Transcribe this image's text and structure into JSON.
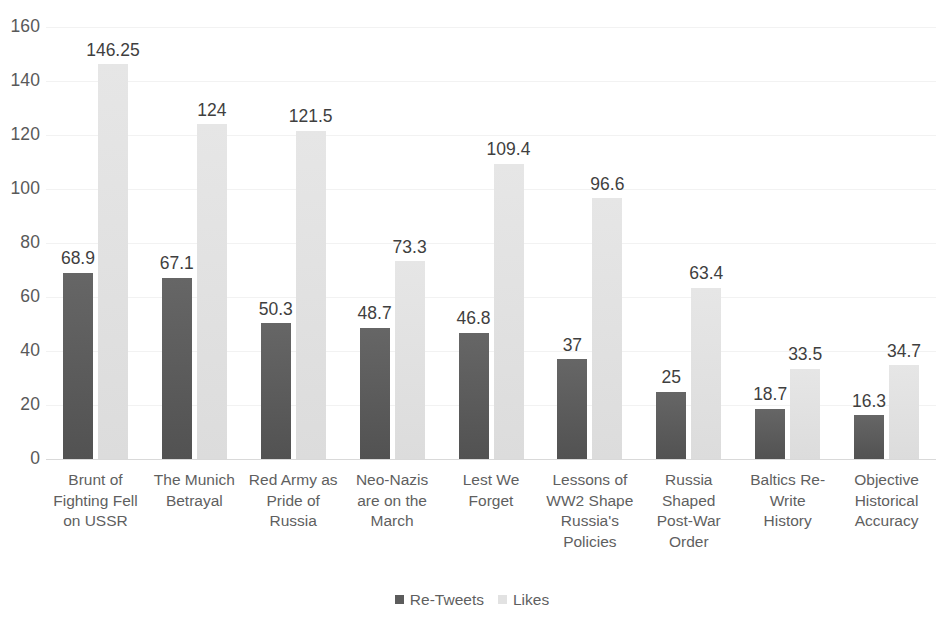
{
  "chart_data": {
    "type": "bar",
    "title": "",
    "xlabel": "",
    "ylabel": "",
    "ylim": [
      0,
      160
    ],
    "ytick_step": 20,
    "yticks": [
      160,
      140,
      120,
      100,
      80,
      60,
      40,
      20,
      0
    ],
    "grid": true,
    "legend_position": "bottom",
    "categories": [
      "Brunt of Fighting Fell on USSR",
      "The Munich Betrayal",
      "Red Army as Pride of Russia",
      "Neo-Nazis are on the March",
      "Lest We Forget",
      "Lessons of WW2 Shape Russia's Policies",
      "Russia Shaped Post-War Order",
      "Baltics Re-Write History",
      "Objective Historical Accuracy"
    ],
    "category_lines": [
      [
        "Brunt of",
        "Fighting Fell",
        "on USSR"
      ],
      [
        "The Munich",
        "Betrayal"
      ],
      [
        "Red Army as",
        "Pride of",
        "Russia"
      ],
      [
        "Neo-Nazis",
        "are on the",
        "March"
      ],
      [
        "Lest We",
        "Forget"
      ],
      [
        "Lessons of",
        "WW2 Shape",
        "Russia's",
        "Policies"
      ],
      [
        "Russia",
        "Shaped",
        "Post-War",
        "Order"
      ],
      [
        "Baltics Re-",
        "Write",
        "History"
      ],
      [
        "Objective",
        "Historical",
        "Accuracy"
      ]
    ],
    "series": [
      {
        "name": "Re-Tweets",
        "color": "#5c5c5c",
        "values": [
          68.9,
          67.1,
          50.3,
          48.7,
          46.8,
          37,
          25,
          18.7,
          16.3
        ],
        "labels": [
          "68.9",
          "67.1",
          "50.3",
          "48.7",
          "46.8",
          "37",
          "25",
          "18.7",
          "16.3"
        ]
      },
      {
        "name": "Likes",
        "color": "#e2e2e2",
        "values": [
          146.25,
          124,
          121.5,
          73.3,
          109.4,
          96.6,
          63.4,
          33.5,
          34.7
        ],
        "labels": [
          "146.25",
          "124",
          "121.5",
          "73.3",
          "109.4",
          "96.6",
          "63.4",
          "33.5",
          "34.7"
        ]
      }
    ]
  },
  "legend": {
    "items": [
      {
        "label": "Re-Tweets",
        "swatch": "retweets"
      },
      {
        "label": "Likes",
        "swatch": "likes"
      }
    ]
  }
}
